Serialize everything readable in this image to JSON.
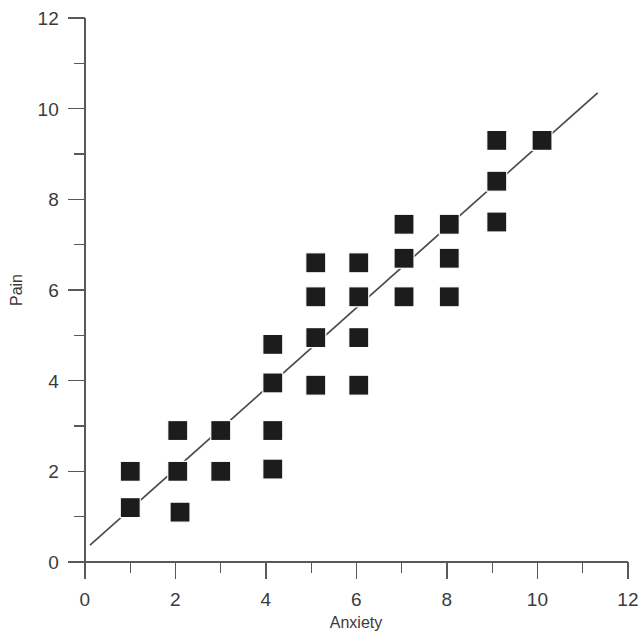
{
  "chart_data": {
    "type": "scatter",
    "title": "",
    "xlabel": "Anxiety",
    "ylabel": "Pain",
    "xlim": [
      0,
      12
    ],
    "ylim": [
      0,
      12
    ],
    "grid": false,
    "legend": null,
    "x_ticks_major": [
      0,
      2,
      4,
      6,
      8,
      10,
      12
    ],
    "x_ticks_minor": [
      1,
      3,
      5,
      7,
      9,
      11
    ],
    "y_ticks_major": [
      0,
      2,
      4,
      6,
      8,
      10,
      12
    ],
    "y_ticks_minor": [
      1,
      3,
      5,
      7,
      9,
      11
    ],
    "x_tick_labels": [
      "0",
      "2",
      "4",
      "6",
      "8",
      "10",
      "12"
    ],
    "y_tick_labels": [
      "0",
      "2",
      "4",
      "6",
      "8",
      "10",
      "12"
    ],
    "marker_style": "filled-square",
    "marker_color": "#1c1c1c",
    "line_color": "#4a4a4a",
    "points": [
      {
        "x": 1.0,
        "y": 2.0
      },
      {
        "x": 1.0,
        "y": 1.2
      },
      {
        "x": 2.05,
        "y": 2.9
      },
      {
        "x": 2.05,
        "y": 2.0
      },
      {
        "x": 2.1,
        "y": 1.1
      },
      {
        "x": 3.0,
        "y": 2.9
      },
      {
        "x": 3.0,
        "y": 2.0
      },
      {
        "x": 4.15,
        "y": 4.8
      },
      {
        "x": 4.15,
        "y": 3.95
      },
      {
        "x": 4.15,
        "y": 2.9
      },
      {
        "x": 4.15,
        "y": 2.05
      },
      {
        "x": 5.1,
        "y": 6.6
      },
      {
        "x": 5.1,
        "y": 5.85
      },
      {
        "x": 5.1,
        "y": 4.95
      },
      {
        "x": 5.1,
        "y": 3.9
      },
      {
        "x": 6.05,
        "y": 6.6
      },
      {
        "x": 6.05,
        "y": 5.85
      },
      {
        "x": 6.05,
        "y": 4.95
      },
      {
        "x": 6.05,
        "y": 3.9
      },
      {
        "x": 7.05,
        "y": 7.45
      },
      {
        "x": 7.05,
        "y": 6.7
      },
      {
        "x": 7.05,
        "y": 5.85
      },
      {
        "x": 8.05,
        "y": 7.45
      },
      {
        "x": 8.05,
        "y": 6.7
      },
      {
        "x": 8.05,
        "y": 5.85
      },
      {
        "x": 9.1,
        "y": 9.3
      },
      {
        "x": 9.1,
        "y": 8.4
      },
      {
        "x": 9.1,
        "y": 7.5
      },
      {
        "x": 10.1,
        "y": 9.3
      }
    ],
    "fit_line": {
      "x_start": 0.11,
      "y_start": 0.37,
      "x_end": 11.33,
      "y_end": 10.35,
      "slope": 0.89,
      "intercept": 0.27
    }
  }
}
